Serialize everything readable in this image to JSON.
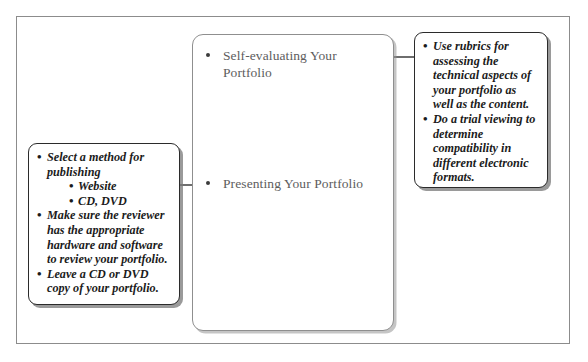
{
  "diagram": {
    "frame": {
      "name": "outer-frame"
    },
    "center_box": {
      "items": [
        {
          "label": "Self-evaluating Your Portfolio"
        },
        {
          "label": "Presenting Your Portfolio"
        }
      ]
    },
    "callouts": [
      {
        "id": "left-callout",
        "position": "left",
        "connects_to": "Presenting Your Portfolio",
        "bullets": [
          {
            "text": "Select a method for publishing",
            "sub_bullets": [
              {
                "text": "Website"
              },
              {
                "text": "CD, DVD"
              }
            ]
          },
          {
            "text": "Make sure the reviewer has the appropriate hardware and software to review your portfolio.",
            "sub_bullets": []
          },
          {
            "text": "Leave a CD or DVD copy of your portfolio.",
            "sub_bullets": []
          }
        ]
      },
      {
        "id": "right-callout",
        "position": "right",
        "connects_to": "Self-evaluating Your Portfolio",
        "bullets": [
          {
            "text": "Use rubrics for assessing the technical aspects of your portfolio as well as the content.",
            "sub_bullets": []
          },
          {
            "text": "Do a trial viewing to determine compatibility in different electronic formats.",
            "sub_bullets": []
          }
        ]
      }
    ],
    "bullet_glyph": "•",
    "colors": {
      "frame_border": "#8c8c8c",
      "center_box_border": "#8f8f8f",
      "center_text": "#5d5d5d",
      "callout_border": "#2b2b2b",
      "callout_text": "#1b1b1b",
      "connector": "#6e6e6e",
      "background": "#ffffff"
    }
  }
}
